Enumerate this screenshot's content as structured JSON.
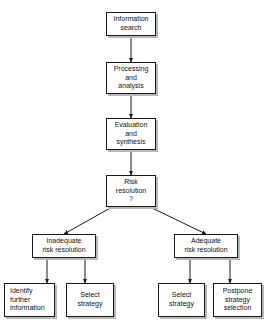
{
  "diagram": {
    "background_color": "#ffffff",
    "line_color": "#1a1a1a",
    "box_border_color": "#1a1a1a",
    "box_fill_color": "#ffffff",
    "shadow_color": "#b8b8b8",
    "nodes": [
      {
        "id": "information-search",
        "label": "Information\nsearch",
        "x": 106,
        "y": 12,
        "w": 50,
        "h": 24,
        "align": "center"
      },
      {
        "id": "processing-and-analysis",
        "label": "Processing\nand\nanalysis",
        "x": 106,
        "y": 62,
        "w": 50,
        "h": 32,
        "align": "center"
      },
      {
        "id": "evaluation-and-synthesis",
        "label": "Evaluation\nand\nsynthesis",
        "x": 106,
        "y": 118,
        "w": 50,
        "h": 32,
        "align": "center"
      },
      {
        "id": "risk-resolution",
        "label": "Risk\nresolution\n?",
        "x": 106,
        "y": 175,
        "w": 50,
        "h": 32,
        "align": "center"
      },
      {
        "id": "inadequate-risk-resolution",
        "label": "Inadequate\nrisk resolution",
        "x": 32,
        "y": 234,
        "w": 64,
        "h": 24,
        "align": "center"
      },
      {
        "id": "adequate-risk-resolution",
        "label": "Adequate\nrisk resolution",
        "x": 174,
        "y": 234,
        "w": 64,
        "h": 24,
        "align": "center"
      },
      {
        "id": "identify-further-information",
        "label": "Identify\nfurther\ninformation",
        "x": 4,
        "y": 283,
        "w": 51,
        "h": 34,
        "align": "left"
      },
      {
        "id": "select-strategy-left",
        "label": "Select\nstrategy",
        "x": 66,
        "y": 283,
        "w": 48,
        "h": 34,
        "align": "center"
      },
      {
        "id": "select-strategy-right",
        "label": "Select\nstrategy",
        "x": 158,
        "y": 283,
        "w": 47,
        "h": 34,
        "align": "center"
      },
      {
        "id": "postpone-strategy-selection",
        "label": "Postpone\nstrategy\nselection",
        "x": 213,
        "y": 283,
        "w": 49,
        "h": 34,
        "align": "center"
      }
    ],
    "connectors": [
      {
        "id": "information-search-to-processing",
        "from": "information-search",
        "to": "processing-and-analysis",
        "kind": "vertical-arrow",
        "x1": 131,
        "y1": 36,
        "x2": 131,
        "y2": 62
      },
      {
        "id": "processing-to-evaluation",
        "from": "processing-and-analysis",
        "to": "evaluation-and-synthesis",
        "kind": "vertical-arrow",
        "x1": 131,
        "y1": 94,
        "x2": 131,
        "y2": 118
      },
      {
        "id": "evaluation-to-risk-resolution",
        "from": "evaluation-and-synthesis",
        "to": "risk-resolution",
        "kind": "vertical-arrow",
        "x1": 131,
        "y1": 150,
        "x2": 131,
        "y2": 175
      },
      {
        "id": "risk-resolution-to-inadequate",
        "from": "risk-resolution",
        "to": "inadequate-risk-resolution",
        "kind": "diagonal-arrow",
        "x1": 112,
        "y1": 207,
        "x2": 64,
        "y2": 234
      },
      {
        "id": "risk-resolution-to-adequate",
        "from": "risk-resolution",
        "to": "adequate-risk-resolution",
        "kind": "diagonal-arrow",
        "x1": 150,
        "y1": 207,
        "x2": 206,
        "y2": 234
      },
      {
        "id": "inadequate-to-identify-further-information",
        "from": "inadequate-risk-resolution",
        "to": "identify-further-information",
        "kind": "vertical-arrow",
        "x1": 47,
        "y1": 258,
        "x2": 47,
        "y2": 283
      },
      {
        "id": "inadequate-to-select-strategy-left",
        "from": "inadequate-risk-resolution",
        "to": "select-strategy-left",
        "kind": "vertical-arrow",
        "x1": 85,
        "y1": 258,
        "x2": 85,
        "y2": 283
      },
      {
        "id": "adequate-to-select-strategy-right",
        "from": "adequate-risk-resolution",
        "to": "select-strategy-right",
        "kind": "vertical-arrow",
        "x1": 190,
        "y1": 258,
        "x2": 190,
        "y2": 283
      },
      {
        "id": "adequate-to-postpone-strategy-selection",
        "from": "adequate-risk-resolution",
        "to": "postpone-strategy-selection",
        "kind": "vertical-arrow",
        "x1": 230,
        "y1": 258,
        "x2": 230,
        "y2": 283
      }
    ]
  }
}
